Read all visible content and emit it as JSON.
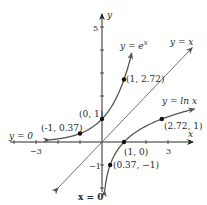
{
  "chart_data": {
    "type": "line",
    "title": "",
    "xlabel": "x",
    "ylabel": "y",
    "xlim": [
      -4,
      4
    ],
    "ylim": [
      -2,
      6
    ],
    "grid": false,
    "x_ticks": [
      {
        "value": -3,
        "label": "-3"
      },
      {
        "value": 3,
        "label": "3"
      }
    ],
    "y_ticks": [
      {
        "value": 5,
        "label": "5"
      },
      {
        "value": -1,
        "label": "-1"
      }
    ],
    "series": [
      {
        "name": "y = e^x",
        "label": "y = e",
        "label_sup": "x",
        "function": "exp",
        "x_range": [
          -2.4,
          1.35
        ]
      },
      {
        "name": "y = ln x",
        "label": "y = ln x",
        "function": "ln",
        "x_range": [
          0.12,
          4.2
        ]
      },
      {
        "name": "y = x",
        "label": "y = x",
        "function": "identity",
        "x_range": [
          -2,
          4.1
        ]
      }
    ],
    "points": [
      {
        "x": 1,
        "y": 2.72,
        "label": "(1, 2.72)"
      },
      {
        "x": 0,
        "y": 1,
        "label": "(0, 1)"
      },
      {
        "x": -1,
        "y": 0.37,
        "label": "(-1, 0.37)"
      },
      {
        "x": 1,
        "y": 0,
        "label": "(1, 0)"
      },
      {
        "x": 2.72,
        "y": 1,
        "label": "(2.72, 1)"
      },
      {
        "x": 0.37,
        "y": -1,
        "label": "(0.37, −1)"
      }
    ],
    "annotations": [
      {
        "text": "y = 0",
        "meaning": "horizontal asymptote of e^x"
      },
      {
        "text": "x = 0",
        "meaning": "vertical asymptote of ln x"
      }
    ]
  },
  "labels": {
    "x_axis": "x",
    "y_axis": "y",
    "asymptote_h": "y = 0",
    "asymptote_v": "x = 0",
    "exp_label": "y = e",
    "exp_sup": "x",
    "ln_label": "y = ln x",
    "id_label": "y = x"
  },
  "colors": {
    "axis": "#2a2a2a",
    "curve": "#555555",
    "line": "#6a6a6a",
    "point": "#111111"
  }
}
